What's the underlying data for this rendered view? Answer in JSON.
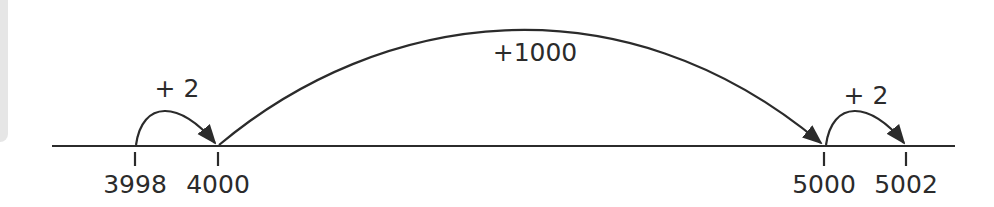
{
  "diagram": {
    "type": "number-line",
    "colors": {
      "stroke": "#2b2b2b",
      "text": "#2b2b2b",
      "side_panel": "#e6e6e6",
      "background": "#ffffff"
    },
    "ticks": [
      {
        "value": "3998",
        "x": 135
      },
      {
        "value": "4000",
        "x": 218
      },
      {
        "value": "5000",
        "x": 824
      },
      {
        "value": "5002",
        "x": 906
      }
    ],
    "jumps": [
      {
        "label": "+ 2",
        "from": "3998",
        "to": "4000"
      },
      {
        "label": "+1000",
        "from": "4000",
        "to": "5000"
      },
      {
        "label": "+ 2",
        "from": "5000",
        "to": "5002"
      }
    ]
  }
}
